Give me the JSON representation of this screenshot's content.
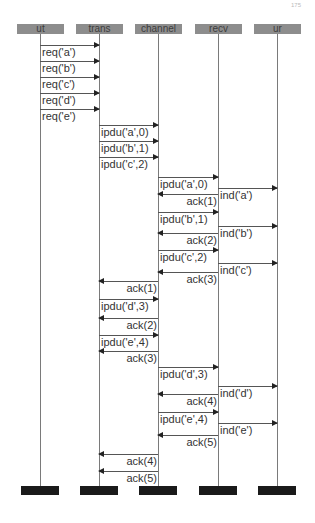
{
  "page_number": "175",
  "participants": [
    {
      "id": "ut",
      "label": "ut",
      "x": 40
    },
    {
      "id": "trans",
      "label": "trans",
      "x": 99
    },
    {
      "id": "channel",
      "label": "channel",
      "x": 158
    },
    {
      "id": "recv",
      "label": "recv",
      "x": 218
    },
    {
      "id": "ur",
      "label": "ur",
      "x": 277
    }
  ],
  "messages": [
    {
      "from": 0,
      "to": 1,
      "y": 45,
      "label": "req('a')"
    },
    {
      "from": 0,
      "to": 1,
      "y": 61,
      "label": "req('b')"
    },
    {
      "from": 0,
      "to": 1,
      "y": 77,
      "label": "req('c')"
    },
    {
      "from": 0,
      "to": 1,
      "y": 93,
      "label": "req('d')"
    },
    {
      "from": 0,
      "to": 1,
      "y": 109,
      "label": "req('e')"
    },
    {
      "from": 1,
      "to": 2,
      "y": 125,
      "label": "ipdu('a',0)"
    },
    {
      "from": 1,
      "to": 2,
      "y": 141,
      "label": "ipdu('b',1)"
    },
    {
      "from": 1,
      "to": 2,
      "y": 157,
      "label": "ipdu('c',2)"
    },
    {
      "from": 2,
      "to": 3,
      "y": 177,
      "label": "ipdu('a',0)"
    },
    {
      "from": 3,
      "to": 4,
      "y": 188,
      "label": "ind('a')"
    },
    {
      "from": 3,
      "to": 2,
      "y": 194,
      "label": "ack(1)"
    },
    {
      "from": 2,
      "to": 3,
      "y": 212,
      "label": "ipdu('b',1)"
    },
    {
      "from": 3,
      "to": 4,
      "y": 226,
      "label": "ind('b')"
    },
    {
      "from": 3,
      "to": 2,
      "y": 233,
      "label": "ack(2)"
    },
    {
      "from": 2,
      "to": 3,
      "y": 250,
      "label": "ipdu('c',2)"
    },
    {
      "from": 3,
      "to": 4,
      "y": 263,
      "label": "ind('c')"
    },
    {
      "from": 3,
      "to": 2,
      "y": 272,
      "label": "ack(3)"
    },
    {
      "from": 2,
      "to": 1,
      "y": 281,
      "label": "ack(1)"
    },
    {
      "from": 1,
      "to": 2,
      "y": 299,
      "label": "ipdu('d',3)"
    },
    {
      "from": 2,
      "to": 1,
      "y": 318,
      "label": "ack(2)"
    },
    {
      "from": 1,
      "to": 2,
      "y": 335,
      "label": "ipdu('e',4)"
    },
    {
      "from": 2,
      "to": 1,
      "y": 351,
      "label": "ack(3)"
    },
    {
      "from": 2,
      "to": 3,
      "y": 367,
      "label": "ipdu('d',3)"
    },
    {
      "from": 3,
      "to": 4,
      "y": 386,
      "label": "ind('d')"
    },
    {
      "from": 3,
      "to": 2,
      "y": 394,
      "label": "ack(4)"
    },
    {
      "from": 2,
      "to": 3,
      "y": 412,
      "label": "ipdu('e',4)"
    },
    {
      "from": 3,
      "to": 4,
      "y": 423,
      "label": "ind('e')"
    },
    {
      "from": 3,
      "to": 2,
      "y": 435,
      "label": "ack(5)"
    },
    {
      "from": 2,
      "to": 1,
      "y": 454,
      "label": "ack(4)"
    },
    {
      "from": 2,
      "to": 1,
      "y": 471,
      "label": "ack(5)"
    }
  ],
  "colors": {
    "header_fill": "#8d8d8d",
    "header_text": "#3d3d3d",
    "footer_fill": "#1a1a1a",
    "lifeline": "#7a7a7a",
    "arrow": "#555555",
    "label_text": "#333333"
  }
}
